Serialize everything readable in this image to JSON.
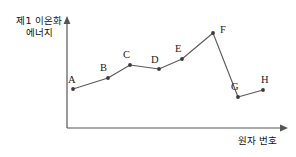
{
  "figure": {
    "axes": {
      "y_label_line1": "제1 이온화",
      "y_label_line2": "에너지",
      "x_label": "원자 번호"
    },
    "colors": {
      "axis": "#555555",
      "line": "#5a5a5a",
      "point": "#3a3a3a",
      "text": "#111111",
      "background": "#ffffff"
    }
  },
  "chart_data": {
    "type": "line",
    "title": "",
    "xlabel": "원자 번호",
    "ylabel": "제1 이온화 에너지",
    "grid": false,
    "legend": "none",
    "axis_style": "arrow-axes-unscaled",
    "categories": [
      "A",
      "B",
      "C",
      "D",
      "E",
      "F",
      "G",
      "H"
    ],
    "point_labels": [
      "A",
      "B",
      "C",
      "D",
      "E",
      "F",
      "G",
      "H"
    ],
    "x": [
      1,
      2,
      3,
      4,
      5,
      6,
      7,
      8
    ],
    "values": [
      18,
      28,
      39,
      36,
      48,
      71,
      19,
      26
    ],
    "xlim": [
      0,
      9
    ],
    "ylim": [
      0,
      100
    ],
    "pixel_points": [
      {
        "label": "A",
        "px": 73,
        "py": 89,
        "lx": 68,
        "ly": 83
      },
      {
        "label": "B",
        "px": 108,
        "py": 78,
        "lx": 100,
        "ly": 71
      },
      {
        "label": "C",
        "px": 130,
        "py": 65,
        "lx": 123,
        "ly": 58
      },
      {
        "label": "D",
        "px": 159,
        "py": 69,
        "lx": 151,
        "ly": 63
      },
      {
        "label": "E",
        "px": 182,
        "py": 59,
        "lx": 175,
        "ly": 52
      },
      {
        "label": "F",
        "px": 213,
        "py": 33,
        "lx": 220,
        "ly": 33
      },
      {
        "label": "G",
        "px": 238,
        "py": 97,
        "lx": 231,
        "ly": 90
      },
      {
        "label": "H",
        "px": 263,
        "py": 90,
        "lx": 261,
        "ly": 83
      }
    ],
    "annotations": [
      "Zigzag trend of first ionization energy across a period",
      "Peak at F",
      "Sharp drop from F to G"
    ]
  }
}
